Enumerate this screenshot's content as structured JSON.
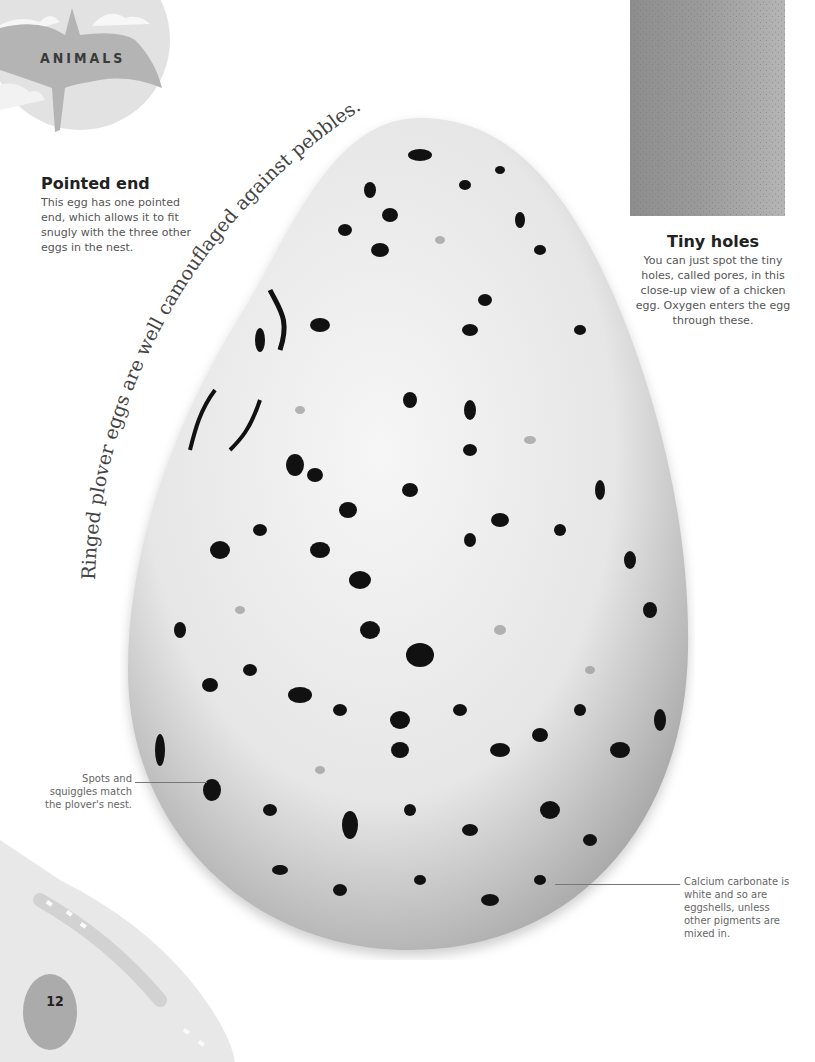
{
  "header": {
    "section_label": "ANIMALS"
  },
  "curved_caption": {
    "text": "Ringed plover eggs are well camouflaged against pebbles."
  },
  "callouts": {
    "pointed_end": {
      "title": "Pointed end",
      "body": "This egg has one pointed end, which allows it to fit snugly with the three other eggs in the nest."
    },
    "tiny_holes": {
      "title": "Tiny holes",
      "body": "You can just spot the tiny holes, called pores, in this close-up view of a chicken egg. Oxygen enters the egg through these."
    }
  },
  "annotations": {
    "spots": "Spots and squiggles match the plover's nest.",
    "calcium": "Calcium carbonate is white and so are eggshells, unless other pigments are mixed in."
  },
  "images": {
    "main": "speckled-ringed-plover-egg",
    "closeup": "chicken-eggshell-pores-closeup"
  },
  "footer": {
    "page_number": "12"
  },
  "colors": {
    "text_dark": "#222222",
    "text_body": "#555555",
    "deco_gray": "#b9b9b9",
    "egg_shell": "#eeeeee",
    "spot": "#111111"
  }
}
